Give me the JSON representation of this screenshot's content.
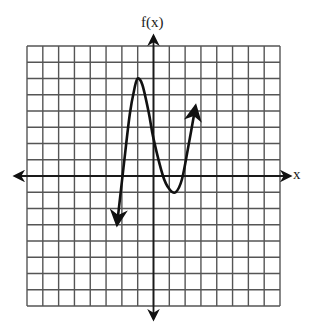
{
  "chart_data": {
    "type": "line",
    "title": "",
    "xlabel": "x",
    "ylabel": "f(x)",
    "grid": true,
    "grid_cells": {
      "columns": 16,
      "rows": 16
    },
    "xlim": [
      -8,
      8
    ],
    "ylim": [
      -8,
      8
    ],
    "tick_labels": [],
    "legend": null,
    "series": [
      {
        "name": "f(x)",
        "description": "cubic-shaped curve with arrows at both ends",
        "x": [
          -2.3,
          -1.9,
          -1.5,
          -1.2,
          -1.0,
          -0.7,
          -0.3,
          0.0,
          0.6,
          1.0,
          1.4,
          1.8,
          2.2,
          2.65
        ],
        "y": [
          -2.95,
          0.5,
          3.8,
          5.4,
          6.0,
          5.6,
          3.9,
          2.3,
          0.0,
          -0.8,
          -1.0,
          -0.2,
          1.8,
          4.25
        ],
        "end_arrows": [
          "start",
          "end"
        ]
      }
    ],
    "key_points": {
      "local_max": [
        -1,
        6
      ],
      "local_min": [
        1.4,
        -1
      ],
      "x_intercept_visible": [
        -1.8,
        0.6,
        1.9
      ]
    }
  },
  "labels": {
    "y_axis": "f(x)",
    "x_axis": "x"
  },
  "colors": {
    "grid": "#555555",
    "axis": "#1a1a1a",
    "curve": "#111111",
    "background": "#ffffff"
  }
}
